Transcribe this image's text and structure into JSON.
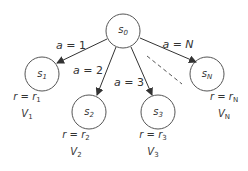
{
  "diagram": {
    "type": "tree",
    "root": {
      "id": "s0",
      "label": "s",
      "sub": "0"
    },
    "nodes": [
      {
        "id": "s1",
        "label": "s",
        "sub": "1",
        "reward_var": "r",
        "reward_sym": "r",
        "reward_sub": "1",
        "value_sym": "V",
        "value_sub": "1"
      },
      {
        "id": "s2",
        "label": "s",
        "sub": "2",
        "reward_var": "r",
        "reward_sym": "r",
        "reward_sub": "2",
        "value_sym": "V",
        "value_sub": "2"
      },
      {
        "id": "s3",
        "label": "s",
        "sub": "3",
        "reward_var": "r",
        "reward_sym": "r",
        "reward_sub": "3",
        "value_sym": "V",
        "value_sub": "3"
      },
      {
        "id": "sN",
        "label": "s",
        "sub": "N",
        "reward_var": "r",
        "reward_sym": "r",
        "reward_sub": "N",
        "value_sym": "V",
        "value_sub": "N"
      }
    ],
    "edges": [
      {
        "from": "s0",
        "to": "s1",
        "var": "a",
        "eq": " = ",
        "val": "1"
      },
      {
        "from": "s0",
        "to": "s2",
        "var": "a",
        "eq": " = ",
        "val": "2"
      },
      {
        "from": "s0",
        "to": "s3",
        "var": "a",
        "eq": " = ",
        "val": "3"
      },
      {
        "from": "s0",
        "to": "sN",
        "var": "a",
        "eq": " = ",
        "val": "N"
      }
    ],
    "ellipsis": "dashed line between a=3 and a=N branches",
    "colors": {
      "stroke": "#333333",
      "text": "#333333",
      "background": "#ffffff"
    }
  }
}
